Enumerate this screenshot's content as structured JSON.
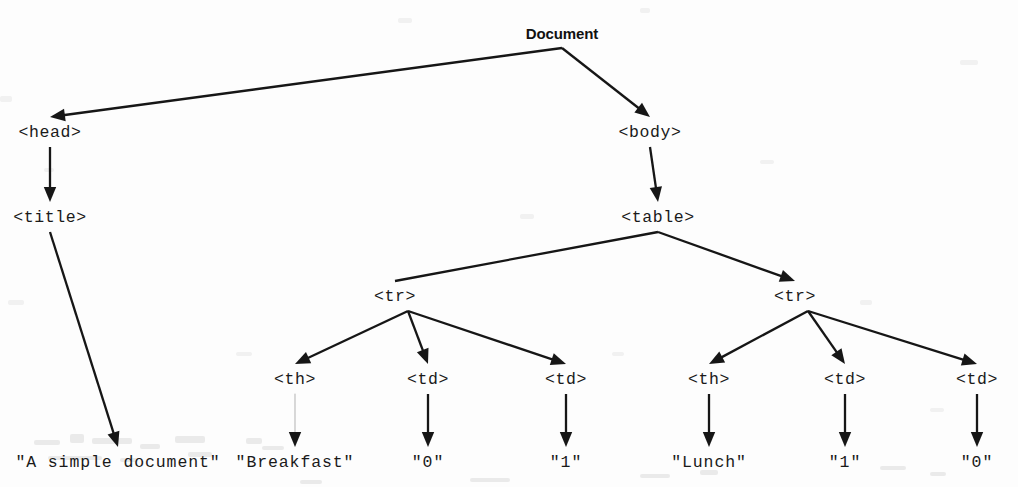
{
  "diagram": {
    "title": "Document",
    "kind": "dom-tree",
    "background_color": "#fdfdfd",
    "ink_color": "#161616",
    "width": 1018,
    "height": 487
  },
  "nodes": {
    "root": {
      "label": "Document",
      "x": 562,
      "y": 33,
      "type": "root"
    },
    "head": {
      "label": "<head>",
      "x": 50,
      "y": 133,
      "type": "tag"
    },
    "body": {
      "label": "<body>",
      "x": 650,
      "y": 133,
      "type": "tag"
    },
    "title": {
      "label": "<title>",
      "x": 50,
      "y": 218,
      "type": "tag"
    },
    "table": {
      "label": "<table>",
      "x": 658,
      "y": 218,
      "type": "tag"
    },
    "title_text": {
      "label": "\"A simple document\"",
      "x": 118,
      "y": 463,
      "type": "text"
    },
    "tr1": {
      "label": "<tr>",
      "x": 395,
      "y": 297,
      "type": "tag"
    },
    "tr2": {
      "label": "<tr>",
      "x": 795,
      "y": 297,
      "type": "tag"
    },
    "th1": {
      "label": "<th>",
      "x": 295,
      "y": 380,
      "type": "tag"
    },
    "td1a": {
      "label": "<td>",
      "x": 428,
      "y": 380,
      "type": "tag"
    },
    "td1b": {
      "label": "<td>",
      "x": 566,
      "y": 380,
      "type": "tag"
    },
    "th2": {
      "label": "<th>",
      "x": 709,
      "y": 380,
      "type": "tag"
    },
    "td2a": {
      "label": "<td>",
      "x": 845,
      "y": 380,
      "type": "tag"
    },
    "td2b": {
      "label": "<td>",
      "x": 977,
      "y": 380,
      "type": "tag"
    },
    "th1_text": {
      "label": "\"Breakfast\"",
      "x": 295,
      "y": 463,
      "type": "text"
    },
    "td1a_text": {
      "label": "\"0\"",
      "x": 428,
      "y": 463,
      "type": "text"
    },
    "td1b_text": {
      "label": "\"1\"",
      "x": 566,
      "y": 463,
      "type": "text"
    },
    "th2_text": {
      "label": "\"Lunch\"",
      "x": 709,
      "y": 463,
      "type": "text"
    },
    "td2a_text": {
      "label": "\"1\"",
      "x": 845,
      "y": 463,
      "type": "text"
    },
    "td2b_text": {
      "label": "\"0\"",
      "x": 977,
      "y": 463,
      "type": "text"
    }
  },
  "edges": [
    {
      "from": "root",
      "to": "head",
      "arrowhead": true,
      "weight": "normal"
    },
    {
      "from": "root",
      "to": "body",
      "arrowhead": true,
      "weight": "normal"
    },
    {
      "from": "head",
      "to": "title",
      "arrowhead": true,
      "weight": "normal"
    },
    {
      "from": "title",
      "to": "title_text",
      "arrowhead": true,
      "weight": "normal"
    },
    {
      "from": "body",
      "to": "table",
      "arrowhead": true,
      "weight": "normal"
    },
    {
      "from": "table",
      "to": "tr1",
      "arrowhead": false,
      "weight": "normal"
    },
    {
      "from": "table",
      "to": "tr2",
      "arrowhead": true,
      "weight": "normal"
    },
    {
      "from": "tr1",
      "to": "th1",
      "arrowhead": true,
      "weight": "normal"
    },
    {
      "from": "tr1",
      "to": "td1a",
      "arrowhead": true,
      "weight": "normal"
    },
    {
      "from": "tr1",
      "to": "td1b",
      "arrowhead": true,
      "weight": "normal"
    },
    {
      "from": "tr2",
      "to": "th2",
      "arrowhead": true,
      "weight": "normal"
    },
    {
      "from": "tr2",
      "to": "td2a",
      "arrowhead": true,
      "weight": "normal"
    },
    {
      "from": "tr2",
      "to": "td2b",
      "arrowhead": true,
      "weight": "normal"
    },
    {
      "from": "th1",
      "to": "th1_text",
      "arrowhead": true,
      "weight": "faint"
    },
    {
      "from": "td1a",
      "to": "td1a_text",
      "arrowhead": true,
      "weight": "normal"
    },
    {
      "from": "td1b",
      "to": "td1b_text",
      "arrowhead": true,
      "weight": "normal"
    },
    {
      "from": "th2",
      "to": "th2_text",
      "arrowhead": true,
      "weight": "normal"
    },
    {
      "from": "td2a",
      "to": "td2a_text",
      "arrowhead": true,
      "weight": "normal"
    },
    {
      "from": "td2b",
      "to": "td2b_text",
      "arrowhead": true,
      "weight": "normal"
    }
  ],
  "fan_origins": {
    "root": {
      "x": 562,
      "y": 48
    },
    "table": {
      "x": 658,
      "y": 232
    },
    "tr1": {
      "x": 408,
      "y": 311
    },
    "tr2": {
      "x": 808,
      "y": 311
    }
  }
}
